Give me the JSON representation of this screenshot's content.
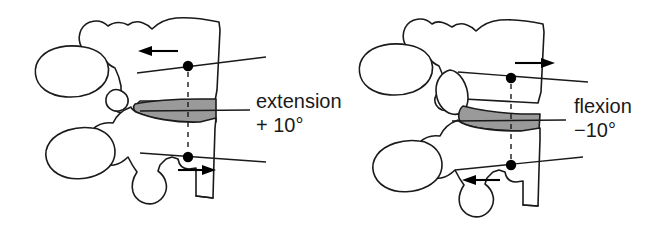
{
  "figure": {
    "background_color": "#ffffff",
    "outline_color": "#1a1a1a",
    "disc_fill_color": "#9a9a9a",
    "marker_color": "#000000"
  },
  "panels": [
    {
      "id": "extension",
      "label_line1": "extension",
      "label_line2": "+ 10°",
      "angle_value": 10,
      "angle_sign": "+",
      "angle_unit": "°",
      "upper_arrow_direction": "left",
      "lower_arrow_direction": "right",
      "disc_wedge": "posterior-open",
      "vertebra_count": 2
    },
    {
      "id": "flexion",
      "label_line1": "flexion",
      "label_line2": "−10°",
      "angle_value": -10,
      "angle_sign": "−",
      "angle_unit": "°",
      "upper_arrow_direction": "right",
      "lower_arrow_direction": "left",
      "disc_wedge": "anterior-open",
      "vertebra_count": 2
    }
  ]
}
